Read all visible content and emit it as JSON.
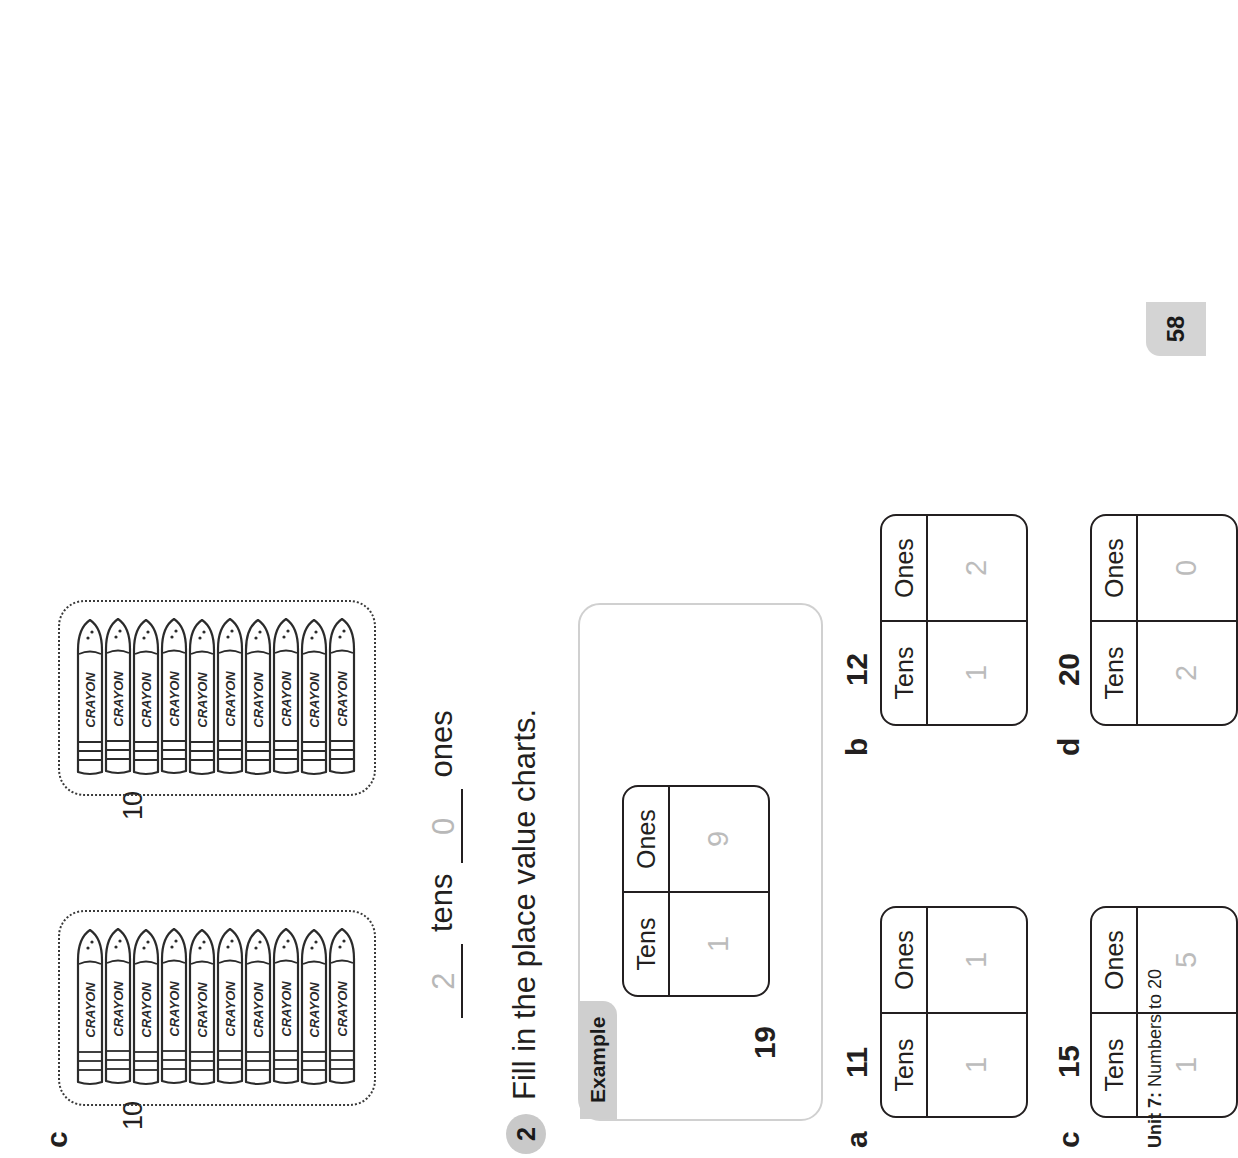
{
  "worksheet": {
    "question1c": {
      "letter": "c",
      "bundles": [
        {
          "count_label": "10",
          "crayon_label": "CRAYON",
          "crayon_count": 10
        },
        {
          "count_label": "10",
          "crayon_label": "CRAYON",
          "crayon_count": 10
        }
      ],
      "answer": {
        "tens_value": "2",
        "tens_word": "tens",
        "ones_value": "0",
        "ones_word": "ones"
      }
    },
    "question2": {
      "number": "2",
      "instruction": "Fill in the place value charts.",
      "example": {
        "tab_label": "Example",
        "number": "19",
        "headers": [
          "Tens",
          "Ones"
        ],
        "values": [
          "1",
          "9"
        ]
      },
      "items": [
        {
          "letter": "a",
          "number": "11",
          "headers": [
            "Tens",
            "Ones"
          ],
          "values": [
            "1",
            "1"
          ]
        },
        {
          "letter": "b",
          "number": "12",
          "headers": [
            "Tens",
            "Ones"
          ],
          "values": [
            "1",
            "2"
          ]
        },
        {
          "letter": "c",
          "number": "15",
          "headers": [
            "Tens",
            "Ones"
          ],
          "values": [
            "1",
            "5"
          ]
        },
        {
          "letter": "d",
          "number": "20",
          "headers": [
            "Tens",
            "Ones"
          ],
          "values": [
            "2",
            "0"
          ]
        }
      ]
    },
    "footer": {
      "unit_prefix": "Unit 7:",
      "unit_title": " Numbers to 20",
      "page_number": "58"
    }
  },
  "colors": {
    "ink": "#231f20",
    "answer_gray": "#bcbcbc",
    "tab_gray": "#cfcfcf",
    "page_tab_gray": "#d4d4d4"
  }
}
